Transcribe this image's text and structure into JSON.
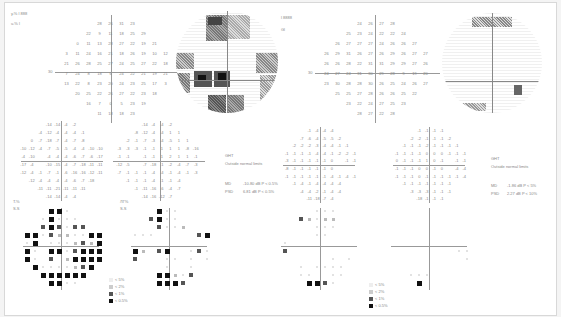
{
  "document": {
    "type": "visual-field-printout",
    "left_eye_block": {
      "header_lines": [
        "y.% l  888",
        "u.% l  "
      ],
      "threshold_grid": [
        [
          "",
          "",
          "",
          "28",
          "26",
          "31",
          "23",
          "",
          "",
          ""
        ],
        [
          "",
          "",
          "22",
          "9",
          "11",
          "18",
          "25",
          "29",
          "",
          ""
        ],
        [
          "",
          "0",
          "11",
          "13",
          "28",
          "27",
          "22",
          "19",
          "21",
          ""
        ],
        [
          "3",
          "11",
          "24",
          "16",
          "21",
          "18",
          "26",
          "19",
          "10",
          "12"
        ],
        [
          "21",
          "26",
          "28",
          "25",
          "27",
          "24",
          "25",
          "27",
          "22",
          "18"
        ],
        [
          "7",
          "24",
          "8",
          "18",
          "6",
          "24",
          "22",
          "21",
          "19",
          "21"
        ],
        [
          "13",
          "22",
          "8",
          "23",
          "20",
          "24",
          "23",
          "25",
          "17",
          "3"
        ],
        [
          "",
          "20",
          "25",
          "22",
          "26",
          "27",
          "22",
          "23",
          "18",
          ""
        ],
        [
          "",
          "",
          "16",
          "7",
          "0",
          "5",
          "23",
          "19",
          "",
          ""
        ],
        [
          "",
          "",
          "",
          "11",
          "18",
          "18",
          "23",
          "",
          "",
          ""
        ]
      ],
      "total_deviation": [
        [
          "",
          "",
          "",
          "-14",
          "-14",
          "-4",
          "-2",
          "",
          "",
          ""
        ],
        [
          "",
          "",
          "-4",
          "-12",
          "-4",
          "-4",
          "-4",
          "-1",
          "",
          ""
        ],
        [
          "",
          "0",
          "-7",
          "-18",
          "-7",
          "-4",
          "-7",
          "-8",
          "",
          ""
        ],
        [
          "-10",
          "-12",
          "-4",
          "-7",
          "-5",
          "-5",
          "-4",
          "-4",
          "-10",
          "-10"
        ],
        [
          "-4",
          "-10",
          "",
          "-4",
          "-4",
          "-4",
          "-6",
          "-7",
          "-6",
          "-17"
        ],
        [
          "-17",
          "-4",
          "",
          "-10",
          "-15",
          "-4",
          "-7",
          "-18",
          "-11",
          "-11"
        ],
        [
          "-12",
          "-4",
          "-1",
          "-7",
          "-1",
          "-6",
          "-16",
          "-16",
          "-12",
          "-11"
        ],
        [
          "",
          "-12",
          "-4",
          "-4",
          "-4",
          "-4",
          "-6",
          "-7",
          "-18",
          ""
        ],
        [
          "",
          "",
          "-11",
          "-11",
          "-21",
          "-11",
          "-11",
          "-11",
          "",
          ""
        ],
        [
          "",
          "",
          "",
          "-14",
          "-14",
          "-4",
          "-4",
          "",
          "",
          ""
        ]
      ],
      "pattern_deviation": [
        [
          "",
          "",
          "",
          "-14",
          "-4",
          "-4",
          "-2",
          "",
          "",
          ""
        ],
        [
          "",
          "",
          "-8",
          "-12",
          "-4",
          "-4",
          "1",
          "1",
          "",
          ""
        ],
        [
          "",
          "-2",
          "-1",
          "-7",
          "-3",
          "-4",
          "-5",
          "1",
          "1",
          ""
        ],
        [
          "-3",
          "-3",
          "-3",
          "-1",
          "-1",
          "1",
          "1",
          "1",
          "-8",
          "-16"
        ],
        [
          "-1",
          "-1",
          "",
          "-1",
          "-1",
          "1",
          "2",
          "1",
          "1",
          "-1"
        ],
        [
          "-12",
          "-5",
          "",
          "-7",
          "-18",
          "-1",
          "-2",
          "-4",
          "-7",
          "-3"
        ],
        [
          "-7",
          "-1",
          "-1",
          "-1",
          "-4",
          "-4",
          "-1",
          "-4",
          "-1",
          "-3"
        ],
        [
          "",
          "-1",
          "-1",
          "-1",
          "-4",
          "-1",
          "-1",
          "-4",
          "",
          ""
        ],
        [
          "",
          "",
          "-1",
          "-11",
          "-16",
          "-6",
          "-4",
          "-7",
          "",
          ""
        ],
        [
          "",
          "",
          "",
          "-14",
          "-16",
          "-12",
          "-7",
          "",
          "",
          ""
        ]
      ],
      "td_prob_label": [
        "T.%",
        "S.S"
      ],
      "pd_prob_label": [
        "ЛГ%",
        "S.S"
      ]
    },
    "right_eye_block": {
      "header_lines": [
        "l  8888",
        "Gl"
      ],
      "threshold_grid": [
        [
          "",
          "",
          "",
          "24",
          "26",
          "27",
          "28",
          "",
          "",
          ""
        ],
        [
          "",
          "",
          "25",
          "23",
          "24",
          "22",
          "22",
          "24",
          "",
          ""
        ],
        [
          "",
          "26",
          "27",
          "27",
          "27",
          "24",
          "26",
          "26",
          "27",
          ""
        ],
        [
          "26",
          "29",
          "31",
          "26",
          "27",
          "26",
          "29",
          "26",
          "27",
          "27"
        ],
        [
          "26",
          "26",
          "28",
          "22",
          "31",
          "31",
          "29",
          "29",
          "27",
          "26"
        ],
        [
          "24",
          "27",
          "24",
          "31",
          "30",
          "29",
          "28",
          "9",
          "19",
          "20"
        ],
        [
          "23",
          "30",
          "28",
          "28",
          "30",
          "26",
          "25",
          "24",
          "26",
          "27"
        ],
        [
          "",
          "25",
          "25",
          "27",
          "28",
          "26",
          "26",
          "25",
          "22",
          ""
        ],
        [
          "",
          "",
          "23",
          "22",
          "24",
          "27",
          "25",
          "23",
          "",
          ""
        ],
        [
          "",
          "",
          "",
          "28",
          "27",
          "22",
          "28",
          "",
          "",
          ""
        ]
      ],
      "total_deviation": [
        [
          "",
          "",
          "",
          "-1",
          "-4",
          "-4",
          "-4",
          "",
          "",
          ""
        ],
        [
          "",
          "",
          "-7",
          "-6",
          "-4",
          "-5",
          "-5",
          "-2",
          "",
          ""
        ],
        [
          "",
          "-2",
          "-2",
          "-2",
          "-3",
          "-4",
          "-4",
          "-1",
          "-1",
          ""
        ],
        [
          "-1",
          "-1",
          "-1",
          "-1",
          "-4",
          "-4",
          "-1",
          "-2",
          "-2",
          "-1"
        ],
        [
          "-3",
          "-1",
          "-1",
          "-1",
          "-1",
          "-1",
          "0",
          "",
          "-1",
          "-1"
        ],
        [
          "-8",
          "-1",
          "-1",
          "-1",
          "-1",
          "-1",
          "0",
          "",
          "",
          ""
        ],
        [
          "-1",
          "-1",
          "-1",
          "-1",
          "-1",
          "-1",
          "-4",
          "-1",
          "-4",
          "-1"
        ],
        [
          "",
          "-1",
          "-4",
          "-1",
          "-4",
          "-4",
          "-4",
          "-4",
          "",
          ""
        ],
        [
          "",
          "",
          "-4",
          "-4",
          "-2",
          "-1",
          "-4",
          "-4",
          "",
          ""
        ],
        [
          "",
          "",
          "",
          "-11",
          "-18",
          "-7",
          "-4",
          "",
          "",
          ""
        ]
      ],
      "pattern_deviation": [
        [
          "",
          "",
          "",
          "-1",
          "-1",
          "-1",
          "-1",
          "",
          "",
          ""
        ],
        [
          "",
          "",
          "-2",
          "-2",
          "-1",
          "-1",
          "-1",
          "-2",
          "",
          ""
        ],
        [
          "",
          "-1",
          "-1",
          "-1",
          "-2",
          "-1",
          "-1",
          "-1",
          "-1",
          ""
        ],
        [
          "-1",
          "-1",
          "-1",
          "-1",
          "0",
          "0",
          "0",
          "-1",
          "-1",
          "-1"
        ],
        [
          "0",
          "-1",
          "-1",
          "-1",
          "1",
          "0",
          "-1",
          "",
          "-1",
          "-1"
        ],
        [
          "-1",
          "-1",
          "-1",
          "0",
          "0",
          "-1",
          "0",
          "",
          "-4",
          "-4"
        ],
        [
          "-1",
          "-1",
          "-1",
          "0",
          "-1",
          "-1",
          "-1",
          "-1",
          "-1",
          "-4"
        ],
        [
          "",
          "-1",
          "-1",
          "-1",
          "-1",
          "-1",
          "-1",
          "-1",
          "",
          ""
        ],
        [
          "",
          "",
          "-3",
          "-3",
          "-3",
          "-1",
          "-1",
          "-1",
          "",
          ""
        ],
        [
          "",
          "",
          "",
          "-18",
          "-1",
          "-1",
          "-1",
          "",
          "",
          ""
        ]
      ]
    },
    "indices_left": {
      "ght_label": "GHT",
      "ght_value": "Outside normal limits",
      "md_label": "MD",
      "md_value": "-10.80 dB P < 0.5%",
      "psd_label": "PSD",
      "psd_value": "6.81 dB P < 0.5%"
    },
    "indices_right": {
      "ght_label": "GHT",
      "ght_value": "Outside normal limits",
      "md_label": "MD",
      "md_value": "-1.86 dB P < 5%",
      "psd_label": "PSD",
      "psd_value": "2.27 dB P < 10%"
    },
    "legend_left": [
      "< 5%",
      "< 2%",
      "< 1%",
      "< 0.5%"
    ],
    "legend_right": [
      "< 5%",
      "< 2%",
      "< 1%",
      "< 0.5%"
    ],
    "axis_label_left": "30",
    "axis_label_right": "30",
    "prob_left_td": [
      "-",
      "-",
      "-",
      "4",
      "4",
      "1",
      "0",
      "",
      "",
      ""
    ],
    "colors": {
      "paper": "#ffffff",
      "background": "#f4f4f4",
      "ink": "#111111",
      "grid": "#999999"
    }
  }
}
